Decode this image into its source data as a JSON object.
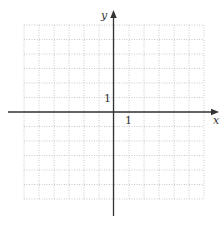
{
  "chart_data": {
    "type": "line",
    "title": "",
    "xlabel": "x",
    "ylabel": "y",
    "xlim": [
      -6,
      6
    ],
    "ylim": [
      -6,
      6
    ],
    "grid": true,
    "grid_style": "dotted",
    "grid_step": 1,
    "tick_labels": {
      "x": [
        {
          "value": 1,
          "label": "1"
        }
      ],
      "y": [
        {
          "value": 1,
          "label": "1"
        }
      ]
    },
    "series": [],
    "legend": null
  },
  "colors": {
    "grid": "#c8c8c8",
    "axis": "#333333",
    "text": "#333333",
    "background": "#ffffff"
  },
  "labels": {
    "x_axis": "x",
    "y_axis": "y",
    "x_tick_1": "1",
    "y_tick_1": "1"
  }
}
